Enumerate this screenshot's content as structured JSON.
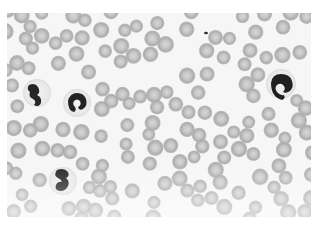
{
  "image": {
    "description": "Grayscale light micrograph of a peripheral blood smear showing numerous red blood cells and four neutrophils with segmented dark nuclei",
    "colors": {
      "background": "#f4f4f4",
      "rbc_rim": "#a9a9a9",
      "rbc_center": "#cfcfcf",
      "wbc_halo": "#ececec",
      "nucleus": "#2a2a2a"
    },
    "neutrophils": [
      {
        "x": 28,
        "y": 77
      },
      {
        "x": 68,
        "y": 87
      },
      {
        "x": 273,
        "y": 68
      },
      {
        "x": 55,
        "y": 167
      }
    ],
    "platelet": {
      "x": 199,
      "y": 20
    }
  }
}
